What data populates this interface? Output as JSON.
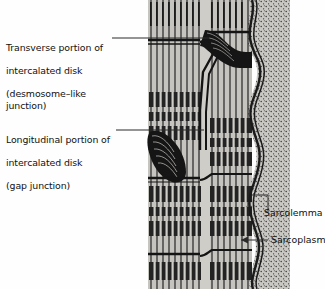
{
  "figure": {
    "background_color": "#fefefe"
  },
  "labels": {
    "transverse": {
      "line1": "Transverse portion of",
      "line2": "intercalated disk",
      "line3": "(desmosome–like junction)"
    },
    "longitudinal": {
      "line1": "Longitudinal portion of",
      "line2": "intercalated disk",
      "line3": "(gap junction)"
    },
    "sarcolemma": "Sarcolemma",
    "sarcoplasm": "Sarcoplasm"
  },
  "colors": {
    "ink": "#1a1a1a",
    "leader": "#2a2a2a",
    "fiber_fill": "#b9b7b2",
    "fiber_fill_light": "#c9c7c2",
    "sarcoplasm_fill": "#b0aea9",
    "myofibril_dark": "#262626",
    "background": "#fefefe"
  },
  "structures": {
    "myofibril_columns": 2,
    "striation_bands_per_column": 6,
    "intercalated_disk_steps": 2,
    "sarcolemma_style": "wavy-double-line",
    "sarcoplasm_texture": "stipple"
  }
}
